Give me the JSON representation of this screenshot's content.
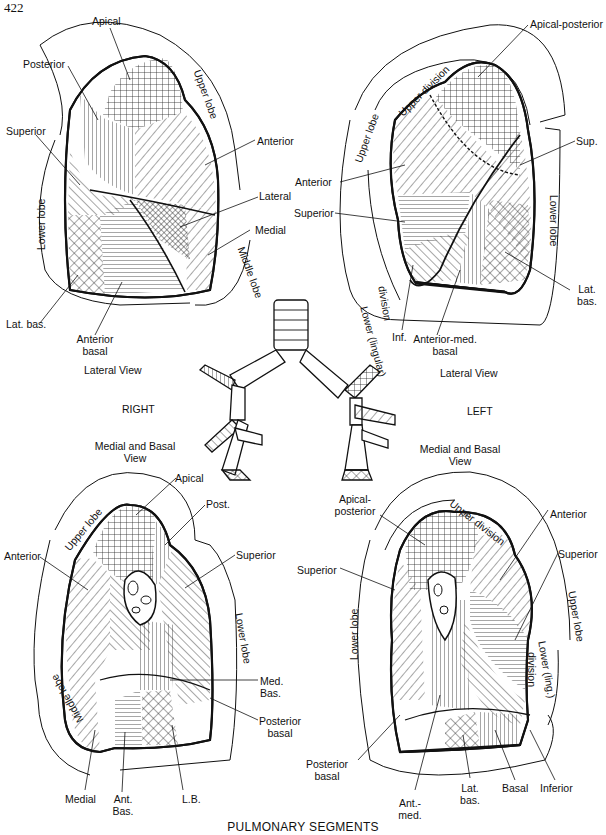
{
  "page_number": "422",
  "title": "PULMONARY SEGMENTS",
  "center": {
    "right": "RIGHT",
    "left": "LEFT"
  },
  "right_lateral": {
    "view": "Lateral View",
    "lobes": {
      "upper": "Upper lobe",
      "lower": "Lower lobe",
      "middle": "Middle lobe"
    },
    "segments": {
      "apical": "Apical",
      "posterior": "Posterior",
      "superior": "Superior",
      "anterior": "Anterior",
      "lateral": "Lateral",
      "medial": "Medial",
      "lat_bas": "Lat. bas.",
      "anterior_basal_1": "Anterior",
      "anterior_basal_2": "basal"
    }
  },
  "left_lateral": {
    "view": "Lateral View",
    "lobes": {
      "upper": "Upper lobe",
      "upper_division": "Upper division",
      "lower": "Lower lobe",
      "lower_lingular": "Lower (lingular)",
      "division": "division"
    },
    "segments": {
      "apical_posterior": "Apical-posterior",
      "anterior": "Anterior",
      "sup": "Sup.",
      "superior": "Superior",
      "inf": "Inf.",
      "anterior_med_1": "Anterior-med.",
      "anterior_med_2": "basal",
      "lat_bas_1": "Lat.",
      "lat_bas_2": "bas."
    }
  },
  "right_medial": {
    "view_1": "Medial and Basal",
    "view_2": "View",
    "lobes": {
      "upper": "Upper lobe",
      "lower": "Lower lobe",
      "middle": "Middle lobe"
    },
    "segments": {
      "apical": "Apical",
      "post": "Post.",
      "anterior": "Anterior",
      "superior": "Superior",
      "med_bas_1": "Med.",
      "med_bas_2": "Bas.",
      "posterior_basal_1": "Posterior",
      "posterior_basal_2": "basal",
      "medial": "Medial",
      "ant_bas_1": "Ant.",
      "ant_bas_2": "Bas.",
      "lb": "L.B."
    }
  },
  "left_medial": {
    "view_1": "Medial and Basal",
    "view_2": "View",
    "lobes": {
      "upper_division": "Upper division",
      "upper": "Upper lobe",
      "lower": "Lower lobe",
      "lower_ling": "Lower (ling.)",
      "division": "division"
    },
    "segments": {
      "apical_posterior_1": "Apical-",
      "apical_posterior_2": "posterior",
      "anterior": "Anterior",
      "superior_right": "Superior",
      "superior_left": "Superior",
      "posterior_basal_1": "Posterior",
      "posterior_basal_2": "basal",
      "ant_med_1": "Ant.-",
      "ant_med_2": "med.",
      "lat_bas_1": "Lat.",
      "lat_bas_2": "bas.",
      "basal": "Basal",
      "inferior": "Inferior"
    }
  }
}
